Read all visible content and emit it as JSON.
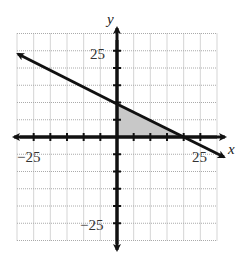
{
  "chart_data": {
    "type": "line",
    "title": "",
    "xlabel": "x",
    "ylabel": "y",
    "xlim": [
      -30,
      30
    ],
    "ylim": [
      -30,
      30
    ],
    "grid": true,
    "grid_step": 5,
    "tick_labels": {
      "x": [
        "-25",
        "25"
      ],
      "y": [
        "25",
        "-25"
      ]
    },
    "series": [
      {
        "name": "boundary line",
        "equation": "y = -0.5x + 10",
        "x": [
          -30,
          0,
          20,
          30
        ],
        "y": [
          25,
          10,
          0,
          -5
        ]
      }
    ],
    "shaded_region": {
      "vertices": [
        [
          0,
          0
        ],
        [
          0,
          10
        ],
        [
          20,
          0
        ]
      ],
      "color": "#c8c8c8"
    }
  },
  "labels": {
    "x_axis": "x",
    "y_axis": "y",
    "x_neg": "−25",
    "x_pos": "25",
    "y_pos": "25",
    "y_neg": "−25"
  }
}
